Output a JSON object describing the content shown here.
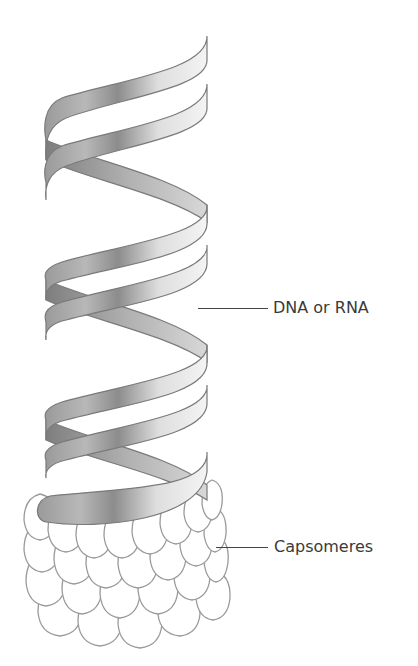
{
  "figure": {
    "labels": [
      {
        "id": "nucleic-acid",
        "text": "DNA or RNA"
      },
      {
        "id": "capsomeres",
        "text": "Capsomeres"
      }
    ]
  },
  "colors": {
    "ribbon_light": "#f2f2f2",
    "ribbon_dark": "#8a8a8a",
    "outline": "#7a7a7a",
    "capsomere_outline": "#9a9a9a",
    "text": "#3a3a3a"
  }
}
